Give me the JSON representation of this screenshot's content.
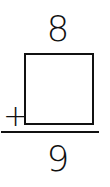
{
  "problem": {
    "addend_top": "8",
    "addend_missing": "",
    "operator": "+",
    "sum": "9"
  }
}
